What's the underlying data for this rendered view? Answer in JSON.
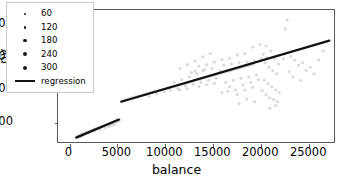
{
  "chart_data": {
    "type": "scatter",
    "title": "",
    "xlabel": "balance",
    "ylabel": "pv",
    "xlim": [
      -1200,
      27800
    ],
    "ylim": [
      170,
      2230
    ],
    "xticks": [
      0,
      5000,
      10000,
      15000,
      20000,
      25000
    ],
    "xticklabels": [
      "0",
      "5000",
      "10000",
      "15000",
      "20000",
      "25000"
    ],
    "yticks": [
      500,
      1000,
      1500,
      2000
    ],
    "yticklabels": [
      "500",
      "1000",
      "1500",
      "2000"
    ],
    "grid": false,
    "legend": {
      "position": "upper-left",
      "frame": true,
      "size_title": "",
      "size_entries": [
        {
          "label": "60",
          "value": 60,
          "marker_px": 2.0
        },
        {
          "label": "120",
          "value": 120,
          "marker_px": 2.7
        },
        {
          "label": "180",
          "value": 180,
          "marker_px": 3.3
        },
        {
          "label": "240",
          "value": 240,
          "marker_px": 3.9
        },
        {
          "label": "300",
          "value": 300,
          "marker_px": 4.5
        }
      ],
      "line_entry": {
        "label": "regression"
      }
    },
    "series": [
      {
        "name": "observations",
        "marker": "circle",
        "color": "#b9b9b9",
        "opacity": 0.55,
        "points": [
          [
            900,
            300
          ],
          [
            1050,
            285
          ],
          [
            1200,
            315
          ],
          [
            1350,
            330
          ],
          [
            1500,
            320
          ],
          [
            1650,
            345
          ],
          [
            1800,
            355
          ],
          [
            1950,
            350
          ],
          [
            2100,
            372
          ],
          [
            2250,
            368
          ],
          [
            2400,
            385
          ],
          [
            2550,
            395
          ],
          [
            2700,
            400
          ],
          [
            2850,
            412
          ],
          [
            3000,
            405
          ],
          [
            3150,
            425
          ],
          [
            3300,
            432
          ],
          [
            3450,
            440
          ],
          [
            3600,
            448
          ],
          [
            3750,
            455
          ],
          [
            3900,
            462
          ],
          [
            4050,
            470
          ],
          [
            4200,
            478
          ],
          [
            4350,
            486
          ],
          [
            4500,
            495
          ],
          [
            4650,
            500
          ],
          [
            4800,
            512
          ],
          [
            4950,
            520
          ],
          [
            5050,
            528
          ],
          [
            5150,
            535
          ],
          [
            4700,
            470
          ],
          [
            4400,
            455
          ],
          [
            4100,
            440
          ],
          [
            3700,
            420
          ],
          [
            3200,
            398
          ],
          [
            2600,
            370
          ],
          [
            2000,
            338
          ],
          [
            1400,
            300
          ],
          [
            1100,
            278
          ],
          [
            5200,
            545
          ],
          [
            5400,
            830
          ],
          [
            5600,
            845
          ],
          [
            5800,
            852
          ],
          [
            6000,
            860
          ],
          [
            6200,
            870
          ],
          [
            6400,
            878
          ],
          [
            6600,
            885
          ],
          [
            6800,
            892
          ],
          [
            7000,
            900
          ],
          [
            7200,
            908
          ],
          [
            7400,
            915
          ],
          [
            7600,
            925
          ],
          [
            7800,
            932
          ],
          [
            8000,
            940
          ],
          [
            8200,
            948
          ],
          [
            8400,
            958
          ],
          [
            8600,
            965
          ],
          [
            8800,
            972
          ],
          [
            9000,
            980
          ],
          [
            9200,
            990
          ],
          [
            9400,
            998
          ],
          [
            9600,
            1005
          ],
          [
            9800,
            1012
          ],
          [
            10000,
            1020
          ],
          [
            10200,
            1030
          ],
          [
            10400,
            1038
          ],
          [
            10600,
            1045
          ],
          [
            10800,
            1052
          ],
          [
            11000,
            1060
          ],
          [
            11200,
            1068
          ],
          [
            11400,
            1078
          ],
          [
            11600,
            1085
          ],
          [
            11800,
            1092
          ],
          [
            12000,
            1100
          ],
          [
            12200,
            1110
          ],
          [
            12400,
            1118
          ],
          [
            12600,
            1125
          ],
          [
            12800,
            1135
          ],
          [
            13000,
            1142
          ],
          [
            13200,
            1150
          ],
          [
            13400,
            1160
          ],
          [
            13600,
            1168
          ],
          [
            13800,
            1175
          ],
          [
            14000,
            1185
          ],
          [
            14200,
            1192
          ],
          [
            14400,
            1200
          ],
          [
            14600,
            1210
          ],
          [
            14800,
            1218
          ],
          [
            15000,
            1225
          ],
          [
            15200,
            1235
          ],
          [
            15400,
            1242
          ],
          [
            15600,
            1250
          ],
          [
            15800,
            1260
          ],
          [
            16000,
            1268
          ],
          [
            16200,
            1275
          ],
          [
            16400,
            1285
          ],
          [
            16600,
            1292
          ],
          [
            16800,
            1300
          ],
          [
            17000,
            1310
          ],
          [
            17200,
            1318
          ],
          [
            17400,
            1325
          ],
          [
            17600,
            1335
          ],
          [
            17800,
            1342
          ],
          [
            18000,
            1350
          ],
          [
            18200,
            1360
          ],
          [
            18400,
            1368
          ],
          [
            18600,
            1375
          ],
          [
            18800,
            1385
          ],
          [
            19000,
            1392
          ],
          [
            19200,
            1400
          ],
          [
            8300,
            905
          ],
          [
            9100,
            940
          ],
          [
            9900,
            970
          ],
          [
            10500,
            1000
          ],
          [
            11300,
            1020
          ],
          [
            12100,
            1060
          ],
          [
            12900,
            1090
          ],
          [
            13700,
            1120
          ],
          [
            14500,
            1150
          ],
          [
            15300,
            1180
          ],
          [
            10900,
            1120
          ],
          [
            11700,
            1160
          ],
          [
            12500,
            1200
          ],
          [
            13300,
            1250
          ],
          [
            13900,
            1300
          ],
          [
            12700,
            1270
          ],
          [
            13100,
            1290
          ],
          [
            14100,
            1310
          ],
          [
            14900,
            1330
          ],
          [
            15700,
            1290
          ],
          [
            16100,
            1380
          ],
          [
            16900,
            1400
          ],
          [
            17700,
            1420
          ],
          [
            18500,
            1430
          ],
          [
            19300,
            1450
          ],
          [
            11500,
            1000
          ],
          [
            12300,
            1020
          ],
          [
            13500,
            1050
          ],
          [
            14300,
            1080
          ],
          [
            15100,
            1100
          ],
          [
            16300,
            1120
          ],
          [
            17100,
            1150
          ],
          [
            17900,
            1180
          ],
          [
            18700,
            1200
          ],
          [
            19500,
            1230
          ],
          [
            16700,
            1050
          ],
          [
            17300,
            1000
          ],
          [
            18100,
            1080
          ],
          [
            18900,
            1120
          ],
          [
            19700,
            1160
          ],
          [
            15900,
            960
          ],
          [
            16500,
            980
          ],
          [
            17500,
            930
          ],
          [
            18300,
            1000
          ],
          [
            19100,
            1040
          ],
          [
            20000,
            1480
          ],
          [
            20400,
            1420
          ],
          [
            20800,
            1350
          ],
          [
            21200,
            1300
          ],
          [
            21600,
            1250
          ],
          [
            20200,
            1550
          ],
          [
            20600,
            1500
          ],
          [
            21000,
            1600
          ],
          [
            21400,
            1480
          ],
          [
            21800,
            1400
          ],
          [
            20100,
            990
          ],
          [
            20500,
            930
          ],
          [
            20900,
            880
          ],
          [
            21300,
            850
          ],
          [
            21700,
            820
          ],
          [
            20300,
            1150
          ],
          [
            20700,
            1100
          ],
          [
            21100,
            1050
          ],
          [
            21500,
            1000
          ],
          [
            21900,
            960
          ],
          [
            22300,
            1480
          ],
          [
            22700,
            2080
          ],
          [
            22500,
            1940
          ],
          [
            23100,
            1520
          ],
          [
            23500,
            1460
          ],
          [
            23900,
            1380
          ],
          [
            24300,
            1420
          ],
          [
            24700,
            1300
          ],
          [
            25100,
            1350
          ],
          [
            25500,
            1250
          ],
          [
            26000,
            1460
          ],
          [
            26500,
            1600
          ],
          [
            22900,
            1280
          ],
          [
            23300,
            1200
          ],
          [
            24100,
            1150
          ],
          [
            19900,
            1700
          ],
          [
            20500,
            1680
          ],
          [
            19100,
            1660
          ],
          [
            18300,
            1560
          ],
          [
            17500,
            1540
          ],
          [
            16700,
            1490
          ],
          [
            15900,
            1470
          ],
          [
            15100,
            1430
          ],
          [
            14300,
            1390
          ],
          [
            13500,
            1370
          ],
          [
            14700,
            1560
          ],
          [
            13900,
            1510
          ],
          [
            13100,
            1450
          ],
          [
            12300,
            1390
          ],
          [
            11500,
            1330
          ],
          [
            19300,
            820
          ],
          [
            18500,
            860
          ],
          [
            17700,
            790
          ],
          [
            20900,
            720
          ],
          [
            21500,
            760
          ]
        ]
      }
    ],
    "regression": {
      "label": "regression",
      "color": "#111111",
      "width_px": 2.2,
      "segments": [
        {
          "x0": 700,
          "y0": 268,
          "x1": 5150,
          "y1": 545
        },
        {
          "x0": 5400,
          "y0": 820,
          "x1": 27100,
          "y1": 1760
        }
      ]
    }
  }
}
